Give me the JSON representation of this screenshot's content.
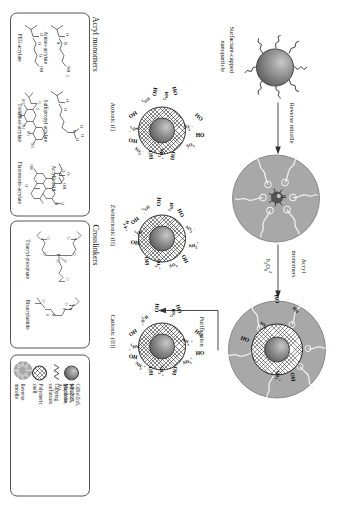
{
  "figure": {
    "type": "scheme"
  },
  "flow": {
    "start_label_line1": "Surfactant-capped",
    "start_label_line2": "nanoparticle",
    "step1_label": "Reverse micelle",
    "step2_label_line1": "Acryl",
    "step2_label_line2": "monomers",
    "step2_reagent": "S2O8 2-",
    "step2_reagent_main": "S",
    "step2_reagent_sub1": "2",
    "step2_reagent_mid": "O",
    "step2_reagent_sub2": "8",
    "step2_reagent_sup": "2-",
    "step3_label": "Purification"
  },
  "products": [
    {
      "id": "anionic",
      "label": "Anionic (I)",
      "groups": [
        "HO",
        "OH",
        "SO3-",
        "NH3+",
        "HN"
      ]
    },
    {
      "id": "zwitterionic",
      "label": "Zwitterionic (II)",
      "groups": [
        "HO",
        "OH",
        "SO3-",
        "NH3+",
        "HN"
      ]
    },
    {
      "id": "cationic",
      "label": "Cationic (III)",
      "groups": [
        "HO",
        "OH",
        "NH3+",
        "HN"
      ]
    }
  ],
  "panels": {
    "acryl_monomers": {
      "title": "Acryl monomers",
      "molecules": [
        {
          "name": "Amino-acrylate",
          "atom_labels": [
            "O",
            "N",
            "H",
            "NH2"
          ]
        },
        {
          "name": "Sulfopropyl acrylate",
          "atom_labels": [
            "O",
            "O",
            "S",
            "O",
            "O",
            "O-"
          ]
        },
        {
          "name": "Acrylic acid",
          "atom_labels": [
            "O",
            "OH"
          ]
        },
        {
          "name": "PEG-acrylate",
          "atom_labels": [
            "O",
            "O",
            "O",
            "OH"
          ]
        },
        {
          "name": "Trehalose-acrylate",
          "atom_labels": [
            "O",
            "HO",
            "HO",
            "OH",
            "OH",
            "O",
            "HO",
            "O"
          ]
        },
        {
          "name": "Fluorescein-acrylate",
          "atom_labels": [
            "O",
            "O",
            "O",
            "OH",
            "O"
          ]
        }
      ]
    },
    "crosslinkers": {
      "title": "Crosslinkers",
      "molecules": [
        {
          "name": "Triacryl-phosphate",
          "atom_labels": [
            "O",
            "O",
            "O",
            "P",
            "O",
            "O",
            "O"
          ]
        },
        {
          "name": "Bisacrylamide",
          "atom_labels": [
            "O",
            "O",
            "N",
            "H",
            "N",
            "H"
          ]
        }
      ]
    },
    "legend": {
      "items": [
        {
          "icon": "core-sphere-icon",
          "label_line1": "CdSe/ZnS, γ-Fe2O3,",
          "label_line2": "Mn:ZnS, Mn:ZnSe, Au,",
          "label_line3": "graphene"
        },
        {
          "icon": "zigzag-surfactant-icon",
          "label_line1": "Capping surfactant"
        },
        {
          "icon": "mesh-shell-icon",
          "label_line1": "Polymeric shell"
        },
        {
          "icon": "reverse-micelle-icon",
          "label_line1": "Reverse micelle"
        }
      ]
    }
  },
  "colors": {
    "micelle_gray": "#a8a8a8",
    "core_dark": "#4a4a4a",
    "line": "#333333",
    "panel_border": "#555555"
  }
}
